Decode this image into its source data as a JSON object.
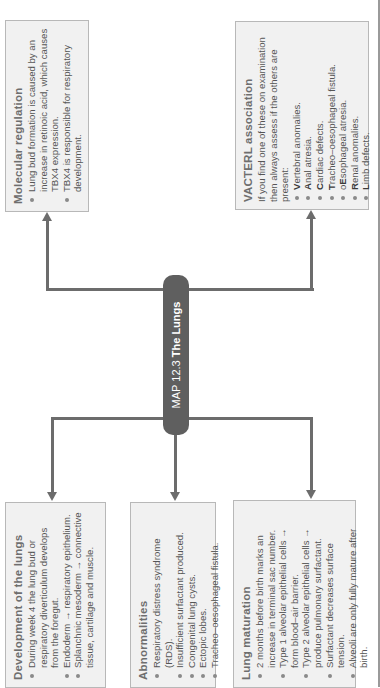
{
  "central": {
    "map_label": "MAP 12.3 ",
    "title": "The Lungs"
  },
  "boxes": {
    "molecular": {
      "heading": "Molecular regulation",
      "items": [
        "Lung bud formation is caused by an increase in retinoic acid, which causes TBX4 expression.",
        "TBX4 is responsible for respiratory development."
      ]
    },
    "vacterl": {
      "heading": "VACTERL association",
      "intro": "If you find one of these on examination then always assess if the others are present:",
      "items": [
        {
          "bold": "V",
          "rest": "ertebral anomalies."
        },
        {
          "bold": "A",
          "rest": "nal atresia."
        },
        {
          "bold": "C",
          "rest": "ardiac defects."
        },
        {
          "bold": "T",
          "rest": "racheo–oesophageal fistula."
        },
        {
          "pre": "o",
          "bold": "E",
          "rest": "sophageal atresia."
        },
        {
          "bold": "R",
          "rest": "enal anomalies."
        },
        {
          "bold": "L",
          "rest": "imb defects."
        }
      ]
    },
    "development": {
      "heading": "Development of the lungs",
      "items": [
        "During week 4 the lung bud or respiratory diverticulum develops from the foregut.",
        "Endoderm → respiratory epithelium.",
        "Splanchnic mesoderm → connective tissue, cartilage and muscle."
      ]
    },
    "abnormalities": {
      "heading": "Abnormalities",
      "items": [
        "Respiratory distress syndrome (RDS).",
        "Insufficient surfactant produced.",
        "Congenital lung cysts.",
        "Ectopic lobes.",
        "Tracheo–oesophageal fistula."
      ]
    },
    "maturation": {
      "heading": "Lung maturation",
      "items": [
        "2 months before birth marks an increase in terminal sac number.",
        "Type 1 alveolar epithelial cells → form blood–air barrier.",
        "Type 2 alveolar epithelial cells → produce pulmonary surfactant.",
        "Surfactant decreases surface tension.",
        "Alveoli are only fully mature after birth."
      ]
    }
  },
  "colors": {
    "pill": "#5f5f5f",
    "connector": "#6c6c6c",
    "box_bg": "#f1f1f1",
    "box_border": "#b8b8b8",
    "heading": "#6e6e6e"
  }
}
